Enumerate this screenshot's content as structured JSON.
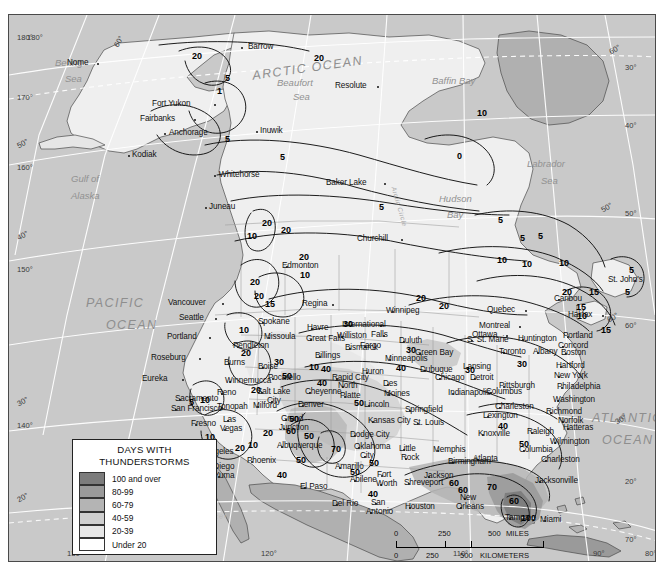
{
  "map": {
    "title": "Days With Thunderstorms",
    "projection_note": "North America",
    "background_color": "#c9c9c9",
    "land_color": "#e8e8e8",
    "frame_color": "#4a4a4a"
  },
  "legend": {
    "title_line1": "DAYS WITH",
    "title_line2": "THUNDERSTORMS",
    "entries": [
      {
        "label": "100 and over",
        "color": "#7c7c7c"
      },
      {
        "label": "80-99",
        "color": "#9a9a9a"
      },
      {
        "label": "60-79",
        "color": "#b4b4b4"
      },
      {
        "label": "40-59",
        "color": "#cfcfcf"
      },
      {
        "label": "20-39",
        "color": "#e6e6e6"
      },
      {
        "label": "Under 20",
        "color": "#ffffff"
      }
    ]
  },
  "scale": {
    "miles": {
      "ticks": [
        "0",
        "250",
        "500"
      ],
      "unit": "MILES"
    },
    "kilometers": {
      "ticks": [
        "0",
        "250",
        "500"
      ],
      "unit": "KILOMETERS"
    }
  },
  "graticule": {
    "left_labels": [
      "180°",
      "170°",
      "160°",
      "150°",
      "140°"
    ],
    "left_lat_labels": [
      "50°",
      "40°",
      "30°",
      "20°"
    ],
    "right_labels": [
      "30°",
      "40°",
      "50°",
      "60°",
      "20°",
      "70°"
    ],
    "right_extra": [
      "60°",
      "60°",
      "50°",
      "30°"
    ],
    "bottom_labels": [
      "130°",
      "120°",
      "110°",
      "90°",
      "80°"
    ],
    "top_labels": [
      "180°",
      "60°"
    ],
    "arctic_circle": "Arctic Circle",
    "tropic_of_cancer": "Tropic of Cancer"
  },
  "water_labels": [
    {
      "text": "ARCTIC OCEAN",
      "x": 243,
      "y": 46,
      "size": "big",
      "rot": -8
    },
    {
      "text": "Beaufort",
      "x": 268,
      "y": 62,
      "size": "sea",
      "rot": 0
    },
    {
      "text": "Sea",
      "x": 284,
      "y": 76,
      "size": "sea",
      "rot": 0
    },
    {
      "text": "Bering",
      "x": 46,
      "y": 42,
      "size": "sea",
      "rot": 0
    },
    {
      "text": "Sea",
      "x": 56,
      "y": 58,
      "size": "sea",
      "rot": 0
    },
    {
      "text": "Gulf of",
      "x": 62,
      "y": 158,
      "size": "sea",
      "rot": 0
    },
    {
      "text": "Alaska",
      "x": 62,
      "y": 175,
      "size": "sea",
      "rot": 0
    },
    {
      "text": "Baffin Bay",
      "x": 423,
      "y": 60,
      "size": "sea",
      "rot": 0
    },
    {
      "text": "Hudson",
      "x": 430,
      "y": 178,
      "size": "sea",
      "rot": 0
    },
    {
      "text": "Bay",
      "x": 438,
      "y": 194,
      "size": "sea",
      "rot": 0
    },
    {
      "text": "Labrador",
      "x": 518,
      "y": 143,
      "size": "sea",
      "rot": 0
    },
    {
      "text": "Sea",
      "x": 532,
      "y": 160,
      "size": "sea",
      "rot": 0
    },
    {
      "text": "PACIFIC",
      "x": 77,
      "y": 281,
      "size": "big",
      "rot": 0
    },
    {
      "text": "OCEAN",
      "x": 97,
      "y": 303,
      "size": "big",
      "rot": 0
    },
    {
      "text": "ATLANTIC",
      "x": 583,
      "y": 396,
      "size": "big",
      "rot": 0
    },
    {
      "text": "OCEAN",
      "x": 593,
      "y": 418,
      "size": "big",
      "rot": 0
    }
  ],
  "cities": [
    {
      "name": "Barrow",
      "x": 232,
      "y": 32,
      "dx": 7
    },
    {
      "name": "Nome",
      "x": 88,
      "y": 48,
      "dx": -30
    },
    {
      "name": "Fort Yukon",
      "x": 205,
      "y": 89,
      "dx": -62
    },
    {
      "name": "Fairbanks",
      "x": 185,
      "y": 104,
      "dx": -54
    },
    {
      "name": "Anchorage",
      "x": 155,
      "y": 118,
      "dx": 5
    },
    {
      "name": "Inuwik",
      "x": 247,
      "y": 116,
      "dx": 4
    },
    {
      "name": "Kodiak",
      "x": 119,
      "y": 140,
      "dx": 4
    },
    {
      "name": "Resolute",
      "x": 368,
      "y": 71,
      "dx": -42
    },
    {
      "name": "Whitehorse",
      "x": 205,
      "y": 160,
      "dx": 5
    },
    {
      "name": "Baker Lake",
      "x": 375,
      "y": 168,
      "dx": -58
    },
    {
      "name": "Juneau",
      "x": 196,
      "y": 192,
      "dx": 4
    },
    {
      "name": "Churchill",
      "x": 392,
      "y": 224,
      "dx": -44
    },
    {
      "name": "Edmonton",
      "x": 277,
      "y": 251,
      "dx": -4
    },
    {
      "name": "Vancouver",
      "x": 213,
      "y": 288,
      "dx": -54
    },
    {
      "name": "Regina",
      "x": 323,
      "y": 289,
      "dx": -30
    },
    {
      "name": "Winnipeg",
      "x": 383,
      "y": 296,
      "dx": -6
    },
    {
      "name": "Seattle",
      "x": 206,
      "y": 303,
      "dx": -36
    },
    {
      "name": "Spokane",
      "x": 253,
      "y": 307,
      "dx": -4
    },
    {
      "name": "Quebec",
      "x": 516,
      "y": 295,
      "dx": -38
    },
    {
      "name": "Montreal",
      "x": 510,
      "y": 311,
      "dx": -40
    },
    {
      "name": "Ottawa",
      "x": 497,
      "y": 320,
      "dx": -34
    },
    {
      "name": "Halifax",
      "x": 593,
      "y": 300,
      "dx": -34
    },
    {
      "name": "St. John's",
      "x": 625,
      "y": 265,
      "dx": -26
    },
    {
      "name": "Caribou",
      "x": 549,
      "y": 284,
      "dx": -4
    },
    {
      "name": "Havre",
      "x": 302,
      "y": 313,
      "dx": -4
    },
    {
      "name": "International",
      "x": 371,
      "y": 310,
      "dx": -38
    },
    {
      "name": "Falls",
      "x": 374,
      "y": 320,
      "dx": -12
    },
    {
      "name": "Williston",
      "x": 332,
      "y": 321,
      "dx": -4
    },
    {
      "name": "Duluth",
      "x": 394,
      "y": 326,
      "dx": -4
    },
    {
      "name": "Portland",
      "x": 200,
      "y": 322,
      "dx": -42
    },
    {
      "name": "Great Falls",
      "x": 301,
      "y": 324,
      "dx": -4
    },
    {
      "name": "Missoula",
      "x": 259,
      "y": 322,
      "dx": -4
    },
    {
      "name": "Fargo",
      "x": 355,
      "y": 331,
      "dx": -4
    },
    {
      "name": "Bismarck",
      "x": 340,
      "y": 333,
      "dx": -4
    },
    {
      "name": "Pendleton",
      "x": 228,
      "y": 331,
      "dx": -4
    },
    {
      "name": "S. St. Marie",
      "x": 462,
      "y": 325,
      "dx": -4
    },
    {
      "name": "Huntington",
      "x": 513,
      "y": 324,
      "dx": -4
    },
    {
      "name": "Portland",
      "x": 558,
      "y": 321,
      "dx": -4
    },
    {
      "name": "Concord",
      "x": 553,
      "y": 331,
      "dx": -4
    },
    {
      "name": "Billings",
      "x": 310,
      "y": 341,
      "dx": -4
    },
    {
      "name": "Roseburg",
      "x": 190,
      "y": 343,
      "dx": -48
    },
    {
      "name": "Green Bay",
      "x": 410,
      "y": 338,
      "dx": -4
    },
    {
      "name": "Toronto",
      "x": 494,
      "y": 337,
      "dx": -4
    },
    {
      "name": "Albany",
      "x": 528,
      "y": 337,
      "dx": -4
    },
    {
      "name": "Boston",
      "x": 556,
      "y": 338,
      "dx": -4
    },
    {
      "name": "Minneapolis",
      "x": 380,
      "y": 344,
      "dx": -4
    },
    {
      "name": "Burns",
      "x": 219,
      "y": 348,
      "dx": -4
    },
    {
      "name": "Boise",
      "x": 253,
      "y": 352,
      "dx": -4
    },
    {
      "name": "Lansing",
      "x": 458,
      "y": 352,
      "dx": -4
    },
    {
      "name": "Hartford",
      "x": 551,
      "y": 351,
      "dx": -4
    },
    {
      "name": "Dubuque",
      "x": 415,
      "y": 355,
      "dx": -4
    },
    {
      "name": "Chicago",
      "x": 430,
      "y": 363,
      "dx": -4
    },
    {
      "name": "Detroit",
      "x": 465,
      "y": 363,
      "dx": -4
    },
    {
      "name": "New York",
      "x": 549,
      "y": 361,
      "dx": -4
    },
    {
      "name": "Eureka",
      "x": 173,
      "y": 364,
      "dx": -40
    },
    {
      "name": "Winnemucca",
      "x": 220,
      "y": 366,
      "dx": -4
    },
    {
      "name": "Pocatello",
      "x": 263,
      "y": 363,
      "dx": -4
    },
    {
      "name": "Huron",
      "x": 357,
      "y": 357,
      "dx": -4
    },
    {
      "name": "Rapid City",
      "x": 327,
      "y": 363,
      "dx": -4
    },
    {
      "name": "Philadelphia",
      "x": 552,
      "y": 372,
      "dx": -4
    },
    {
      "name": "Pittsburgh",
      "x": 494,
      "y": 371,
      "dx": -4
    },
    {
      "name": "Reno",
      "x": 212,
      "y": 378,
      "dx": -4
    },
    {
      "name": "Salt Lake",
      "x": 252,
      "y": 377,
      "dx": -4
    },
    {
      "name": "City",
      "x": 262,
      "y": 386,
      "dx": -4
    },
    {
      "name": "Cheyenne",
      "x": 300,
      "y": 377,
      "dx": -4
    },
    {
      "name": "North",
      "x": 333,
      "y": 371,
      "dx": -4
    },
    {
      "name": "Platte",
      "x": 335,
      "y": 381,
      "dx": -4
    },
    {
      "name": "Des",
      "x": 378,
      "y": 369,
      "dx": -4
    },
    {
      "name": "Moines",
      "x": 379,
      "y": 379,
      "dx": -4
    },
    {
      "name": "Indianapolis",
      "x": 443,
      "y": 378,
      "dx": -4
    },
    {
      "name": "Columbus",
      "x": 481,
      "y": 377,
      "dx": -4
    },
    {
      "name": "Washington",
      "x": 548,
      "y": 385,
      "dx": -4
    },
    {
      "name": "Sacramento",
      "x": 170,
      "y": 384,
      "dx": -4
    },
    {
      "name": "San Francisco",
      "x": 166,
      "y": 394,
      "dx": -4
    },
    {
      "name": "Tonopah",
      "x": 212,
      "y": 392,
      "dx": -4
    },
    {
      "name": "Milford",
      "x": 248,
      "y": 391,
      "dx": -4
    },
    {
      "name": "Denver",
      "x": 293,
      "y": 390,
      "dx": -4
    },
    {
      "name": "Lincoln",
      "x": 359,
      "y": 390,
      "dx": -4
    },
    {
      "name": "Springfield",
      "x": 400,
      "y": 395,
      "dx": -4
    },
    {
      "name": "Charleston",
      "x": 490,
      "y": 392,
      "dx": -4
    },
    {
      "name": "Lexington",
      "x": 478,
      "y": 401,
      "dx": -4
    },
    {
      "name": "Richmond",
      "x": 541,
      "y": 397,
      "dx": -4
    },
    {
      "name": "Norfolk",
      "x": 553,
      "y": 406,
      "dx": -4
    },
    {
      "name": "Fresno",
      "x": 186,
      "y": 409,
      "dx": -4
    },
    {
      "name": "Las",
      "x": 218,
      "y": 405,
      "dx": -4
    },
    {
      "name": "Vegas",
      "x": 215,
      "y": 414,
      "dx": -4
    },
    {
      "name": "Grand",
      "x": 276,
      "y": 404,
      "dx": -4
    },
    {
      "name": "Junction",
      "x": 274,
      "y": 413,
      "dx": -4
    },
    {
      "name": "Kansas City",
      "x": 363,
      "y": 406,
      "dx": -4
    },
    {
      "name": "St. Louis",
      "x": 408,
      "y": 408,
      "dx": -4
    },
    {
      "name": "Knoxville",
      "x": 473,
      "y": 419,
      "dx": -4
    },
    {
      "name": "Raleigh",
      "x": 522,
      "y": 417,
      "dx": -4
    },
    {
      "name": "Hatteras",
      "x": 558,
      "y": 413,
      "dx": -4
    },
    {
      "name": "Los Angeles",
      "x": 185,
      "y": 437,
      "dx": -4
    },
    {
      "name": "Albuquerque",
      "x": 272,
      "y": 431,
      "dx": -4
    },
    {
      "name": "Dodge City",
      "x": 345,
      "y": 420,
      "dx": -4
    },
    {
      "name": "Oklahoma",
      "x": 349,
      "y": 432,
      "dx": -4
    },
    {
      "name": "City",
      "x": 355,
      "y": 441,
      "dx": -4
    },
    {
      "name": "Little",
      "x": 394,
      "y": 434,
      "dx": -4
    },
    {
      "name": "Rock",
      "x": 396,
      "y": 443,
      "dx": -4
    },
    {
      "name": "Memphis",
      "x": 428,
      "y": 435,
      "dx": -4
    },
    {
      "name": "Wilmington",
      "x": 545,
      "y": 427,
      "dx": -4
    },
    {
      "name": "Columbia",
      "x": 514,
      "y": 435,
      "dx": -4
    },
    {
      "name": "Phoenix",
      "x": 242,
      "y": 446,
      "dx": -4
    },
    {
      "name": "San Diego",
      "x": 192,
      "y": 452,
      "dx": -4
    },
    {
      "name": "Yuma",
      "x": 209,
      "y": 461,
      "dx": -4
    },
    {
      "name": "Amarillo",
      "x": 330,
      "y": 452,
      "dx": -4
    },
    {
      "name": "Birmingham",
      "x": 443,
      "y": 447,
      "dx": -4
    },
    {
      "name": "Atlanta",
      "x": 468,
      "y": 444,
      "dx": -4
    },
    {
      "name": "Charleston",
      "x": 536,
      "y": 445,
      "dx": -4
    },
    {
      "name": "Abilene",
      "x": 345,
      "y": 465,
      "dx": -4
    },
    {
      "name": "Fort",
      "x": 372,
      "y": 460,
      "dx": -4
    },
    {
      "name": "Worth",
      "x": 371,
      "y": 469,
      "dx": -4
    },
    {
      "name": "El Paso",
      "x": 295,
      "y": 472,
      "dx": -4
    },
    {
      "name": "Shreveport",
      "x": 399,
      "y": 468,
      "dx": -4
    },
    {
      "name": "Jackson",
      "x": 419,
      "y": 461,
      "dx": -4
    },
    {
      "name": "Jacksonville",
      "x": 530,
      "y": 466,
      "dx": -4
    },
    {
      "name": "Del Rio",
      "x": 327,
      "y": 489,
      "dx": -4
    },
    {
      "name": "San",
      "x": 366,
      "y": 488,
      "dx": -4
    },
    {
      "name": "Antonio",
      "x": 361,
      "y": 497,
      "dx": -4
    },
    {
      "name": "Houston",
      "x": 400,
      "y": 492,
      "dx": -4
    },
    {
      "name": "New",
      "x": 455,
      "y": 483,
      "dx": -4
    },
    {
      "name": "Orleans",
      "x": 451,
      "y": 492,
      "dx": -4
    },
    {
      "name": "Tampa",
      "x": 500,
      "y": 503,
      "dx": -4
    },
    {
      "name": "Miami",
      "x": 535,
      "y": 505,
      "dx": -4
    }
  ],
  "contour_labels": [
    {
      "v": "20",
      "x": 183,
      "y": 36
    },
    {
      "v": "5",
      "x": 216,
      "y": 58
    },
    {
      "v": "20",
      "x": 305,
      "y": 38
    },
    {
      "v": "10",
      "x": 468,
      "y": 93
    },
    {
      "v": "1",
      "x": 208,
      "y": 71
    },
    {
      "v": "5",
      "x": 216,
      "y": 119
    },
    {
      "v": "5",
      "x": 271,
      "y": 137
    },
    {
      "v": "5",
      "x": 370,
      "y": 187
    },
    {
      "v": "20",
      "x": 253,
      "y": 203
    },
    {
      "v": "20",
      "x": 272,
      "y": 210
    },
    {
      "v": "10",
      "x": 238,
      "y": 216
    },
    {
      "v": "5",
      "x": 489,
      "y": 200
    },
    {
      "v": "10",
      "x": 488,
      "y": 240
    },
    {
      "v": "10",
      "x": 550,
      "y": 243
    },
    {
      "v": "5",
      "x": 511,
      "y": 218
    },
    {
      "v": "10",
      "x": 291,
      "y": 255
    },
    {
      "v": "20",
      "x": 290,
      "y": 237
    },
    {
      "v": "20",
      "x": 241,
      "y": 262
    },
    {
      "v": "20",
      "x": 245,
      "y": 276
    },
    {
      "v": "15",
      "x": 256,
      "y": 284
    },
    {
      "v": "20",
      "x": 407,
      "y": 278
    },
    {
      "v": "15",
      "x": 580,
      "y": 272
    },
    {
      "v": "15",
      "x": 567,
      "y": 287
    },
    {
      "v": "15",
      "x": 592,
      "y": 310
    },
    {
      "v": "10",
      "x": 568,
      "y": 296
    },
    {
      "v": "10",
      "x": 230,
      "y": 310
    },
    {
      "v": "30",
      "x": 334,
      "y": 304
    },
    {
      "v": "20",
      "x": 430,
      "y": 286
    },
    {
      "v": "30",
      "x": 397,
      "y": 330
    },
    {
      "v": "30",
      "x": 508,
      "y": 344
    },
    {
      "v": "20",
      "x": 232,
      "y": 333
    },
    {
      "v": "30",
      "x": 265,
      "y": 342
    },
    {
      "v": "40",
      "x": 387,
      "y": 348
    },
    {
      "v": "40",
      "x": 312,
      "y": 349
    },
    {
      "v": "40",
      "x": 308,
      "y": 363
    },
    {
      "v": "50",
      "x": 273,
      "y": 356
    },
    {
      "v": "20",
      "x": 242,
      "y": 370
    },
    {
      "v": "10",
      "x": 191,
      "y": 380
    },
    {
      "v": "5",
      "x": 180,
      "y": 382
    },
    {
      "v": "50",
      "x": 345,
      "y": 383
    },
    {
      "v": "50",
      "x": 280,
      "y": 399
    },
    {
      "v": "60",
      "x": 277,
      "y": 411
    },
    {
      "v": "50",
      "x": 295,
      "y": 416
    },
    {
      "v": "40",
      "x": 489,
      "y": 406
    },
    {
      "v": "50",
      "x": 510,
      "y": 424
    },
    {
      "v": "20",
      "x": 254,
      "y": 413
    },
    {
      "v": "10",
      "x": 239,
      "y": 425
    },
    {
      "v": "10",
      "x": 196,
      "y": 417
    },
    {
      "v": "20",
      "x": 226,
      "y": 428
    },
    {
      "v": "70",
      "x": 322,
      "y": 429
    },
    {
      "v": "50",
      "x": 287,
      "y": 440
    },
    {
      "v": "50",
      "x": 360,
      "y": 443
    },
    {
      "v": "40",
      "x": 268,
      "y": 455
    },
    {
      "v": "50",
      "x": 341,
      "y": 452
    },
    {
      "v": "40",
      "x": 359,
      "y": 474
    },
    {
      "v": "60",
      "x": 440,
      "y": 463
    },
    {
      "v": "60",
      "x": 449,
      "y": 470
    },
    {
      "v": "70",
      "x": 478,
      "y": 467
    },
    {
      "v": "60",
      "x": 500,
      "y": 481
    },
    {
      "v": "100",
      "x": 512,
      "y": 498
    },
    {
      "v": "0",
      "x": 448,
      "y": 136
    },
    {
      "v": "5",
      "x": 529,
      "y": 216
    },
    {
      "v": "10",
      "x": 513,
      "y": 244
    },
    {
      "v": "5",
      "x": 620,
      "y": 250
    },
    {
      "v": "5",
      "x": 616,
      "y": 272
    },
    {
      "v": "20",
      "x": 553,
      "y": 272
    },
    {
      "v": "10",
      "x": 300,
      "y": 347
    },
    {
      "v": "30",
      "x": 456,
      "y": 350
    }
  ]
}
